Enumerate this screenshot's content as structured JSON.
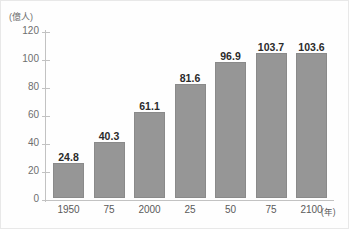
{
  "chart_data": {
    "type": "bar",
    "title": "",
    "xlabel": "(年)",
    "ylabel": "(億人)",
    "categories": [
      "1950",
      "75",
      "2000",
      "25",
      "50",
      "75",
      "2100"
    ],
    "values": [
      24.8,
      40.3,
      61.1,
      81.6,
      96.9,
      103.7,
      103.6
    ],
    "value_labels": [
      "24.8",
      "40.3",
      "61.1",
      "81.6",
      "96.9",
      "103.7",
      "103.6"
    ],
    "ylim": [
      0,
      120
    ],
    "ytick_labels": [
      "0",
      "20",
      "40",
      "60",
      "80",
      "100",
      "120"
    ],
    "ytick_values": [
      0,
      20,
      40,
      60,
      80,
      100,
      120
    ],
    "grid": false,
    "legend": null,
    "bar_color": "#969696",
    "axis_color": "#c2c2c2",
    "label_color": "#2b2b2b"
  }
}
